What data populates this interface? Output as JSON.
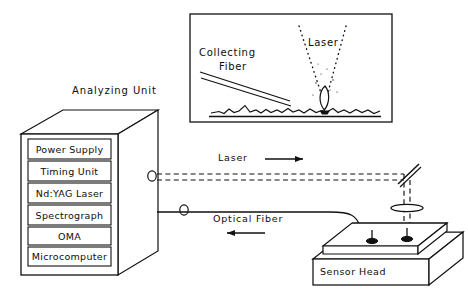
{
  "diagram": {
    "title_analyzing_unit": "Analyzing Unit",
    "cabinet": {
      "name": "analyzing-unit-cabinet",
      "modules": [
        {
          "label": "Power Supply"
        },
        {
          "label": "Timing Unit"
        },
        {
          "label": "Nd:YAG Laser"
        },
        {
          "label": "Spectrograph"
        },
        {
          "label": "OMA"
        },
        {
          "label": "Microcomputer"
        }
      ]
    },
    "inset_panel": {
      "collecting_fiber_label": "Collecting\nFiber",
      "collecting_fiber_line1": "Collecting",
      "collecting_fiber_line2": "Fiber",
      "laser_label": "Laser"
    },
    "paths": {
      "laser_label": "Laser",
      "optical_fiber_label": "Optical Fiber"
    },
    "sensor_head": {
      "label": "Sensor Head"
    },
    "colors": {
      "ink": "#111111",
      "background": "#ffffff"
    }
  }
}
